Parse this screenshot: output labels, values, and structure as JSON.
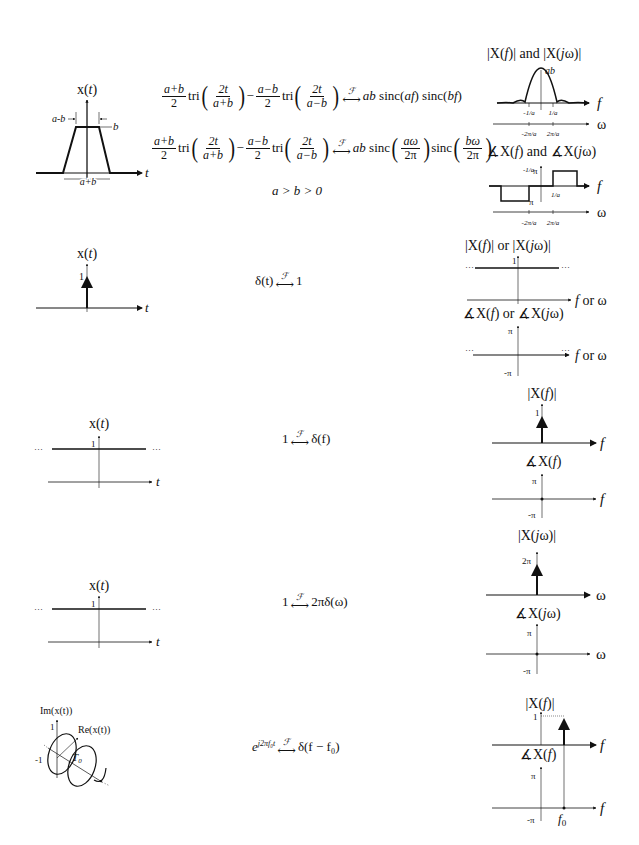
{
  "rows": [
    {
      "id": "trapezoid",
      "signal": {
        "title": "x(t)",
        "width_top_label": "a-b",
        "height_label": "b",
        "width_bottom_label": "a+b",
        "axis_label": "t"
      },
      "equation_f": {
        "term1_num": "a+b",
        "term1_den": "2",
        "tri1_num": "2t",
        "tri1_den": "a+b",
        "minus": "−",
        "term2_num": "a−b",
        "term2_den": "2",
        "tri2_num": "2t",
        "tri2_den": "a−b",
        "tri": "tri",
        "transform_symbol": "ℱ",
        "rhs": "ab sinc(af) sinc(bf)"
      },
      "equation_w": {
        "rhs_prefix": "ab sinc",
        "sinc1_num": "aω",
        "sinc1_den": "2π",
        "sinc2_label": "sinc",
        "sinc2_num": "bω",
        "sinc2_den": "2π"
      },
      "condition": "a > b > 0",
      "magnitude": {
        "title": "|X(f)| and |X(jω)|",
        "peak_label": "ab",
        "f_ticks": [
          "-1/a",
          "1/a"
        ],
        "w_ticks": [
          "-2π/a",
          "2π/a"
        ],
        "f_axis": "f",
        "w_axis": "ω"
      },
      "phase": {
        "title": "∡X(f) and ∡X(jω)",
        "y_ticks": [
          "π",
          "-π"
        ],
        "f_ticks": [
          "-1/a",
          "1/a"
        ],
        "w_ticks": [
          "-2π/a",
          "2π/a"
        ],
        "f_axis": "f",
        "w_axis": "ω"
      }
    },
    {
      "id": "impulse",
      "signal": {
        "title": "x(t)",
        "impulse_label": "1",
        "axis_label": "t"
      },
      "equation": {
        "lhs": "δ(t)",
        "transform_symbol": "ℱ",
        "rhs": "1"
      },
      "magnitude": {
        "title": "|X(f)| or |X(jω)|",
        "level_label": "1",
        "axis": "f or ω",
        "ellipsis": "···"
      },
      "phase": {
        "title": "∡X(f) or ∡X(jω)",
        "y_ticks": [
          "π",
          "-π"
        ],
        "axis": "f or ω",
        "ellipsis": "···"
      }
    },
    {
      "id": "constant-f",
      "signal": {
        "title": "x(t)",
        "level_label": "1",
        "axis_label": "t",
        "ellipsis": "···"
      },
      "equation": {
        "lhs": "1",
        "transform_symbol": "ℱ",
        "rhs": "δ(f)"
      },
      "magnitude": {
        "title": "|X(f)|",
        "impulse_label": "1",
        "axis": "f"
      },
      "phase": {
        "title": "∡X(f)",
        "y_ticks": [
          "π",
          "-π"
        ],
        "axis": "f"
      }
    },
    {
      "id": "constant-w",
      "signal": {
        "title": "x(t)",
        "level_label": "1",
        "axis_label": "t",
        "ellipsis": "···"
      },
      "equation": {
        "lhs": "1",
        "transform_symbol": "ℱ",
        "rhs": "2πδ(ω)"
      },
      "magnitude": {
        "title": "|X(jω)|",
        "impulse_label": "2π",
        "axis": "ω"
      },
      "phase": {
        "title": "∡X(jω)",
        "y_ticks": [
          "π",
          "-π"
        ],
        "axis": "ω"
      }
    },
    {
      "id": "complex-exponential",
      "signal": {
        "im_label": "Im(x(t))",
        "re_label": "Re(x(t))",
        "period_label": "T0",
        "tick_pos": "1",
        "tick_neg": "-1",
        "axis_label": "t"
      },
      "equation": {
        "lhs_base": "e",
        "lhs_exp": "j2πf₀t",
        "transform_symbol": "ℱ",
        "rhs": "δ(f − f₀)"
      },
      "magnitude": {
        "title": "|X(f)|",
        "impulse_label": "1",
        "axis": "f"
      },
      "phase": {
        "title": "∡X(f)",
        "y_ticks": [
          "π",
          "-π"
        ],
        "axis": "f",
        "f0_label": "f0"
      }
    }
  ]
}
